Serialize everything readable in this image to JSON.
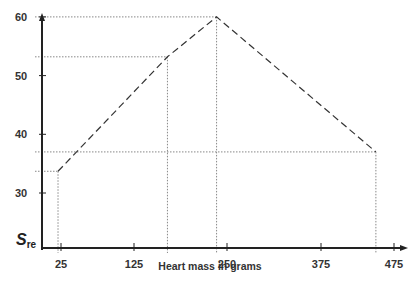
{
  "chart_data": {
    "type": "line",
    "title": "",
    "xlabel": "Heart mass in grams",
    "ylabel": "S",
    "ylabel_subscript": "re",
    "x_ticks": [
      "25",
      "125",
      "250",
      "375",
      "475"
    ],
    "y_ticks": [
      "30",
      "40",
      "50",
      "60"
    ],
    "xlim": [
      0,
      500
    ],
    "ylim": [
      26,
      62
    ],
    "grid": false,
    "legend": null,
    "line_style": "dashed",
    "drop_lines": "dotted",
    "series": [
      {
        "name": "S_re vs heart mass",
        "x": [
          21,
          168,
          234,
          448
        ],
        "y": [
          33.7,
          53.2,
          60,
          37
        ]
      }
    ]
  }
}
